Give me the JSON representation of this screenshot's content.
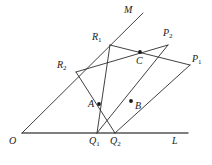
{
  "figure": {
    "width": 212,
    "height": 165,
    "background": "#ffffff",
    "stroke_color": "#2b2b2b",
    "axis_color": "#555555",
    "dot_color": "#1a1a1a",
    "points": {
      "O": {
        "label": "O",
        "sub": "",
        "x": 22,
        "y": 133,
        "label_x": 9,
        "label_y": 136,
        "dot": false
      },
      "L": {
        "label": "L",
        "sub": "",
        "x": 188,
        "y": 133,
        "label_x": 172,
        "label_y": 136,
        "dot": false
      },
      "M": {
        "label": "M",
        "sub": "",
        "x": 143,
        "y": 13,
        "label_x": 124,
        "label_y": 5,
        "dot": false
      },
      "R1": {
        "label": "R",
        "sub": "1",
        "x": 110,
        "y": 45,
        "label_x": 92,
        "label_y": 32,
        "dot": false
      },
      "R2": {
        "label": "R",
        "sub": "2",
        "x": 76,
        "y": 72,
        "label_x": 57,
        "label_y": 60,
        "dot": false
      },
      "P1": {
        "label": "P",
        "sub": "1",
        "x": 190,
        "y": 65,
        "label_x": 192,
        "label_y": 54,
        "dot": false
      },
      "P2": {
        "label": "P",
        "sub": "2",
        "x": 168,
        "y": 45,
        "label_x": 163,
        "label_y": 28,
        "dot": false
      },
      "Q1": {
        "label": "Q",
        "sub": "1",
        "x": 97,
        "y": 133,
        "label_x": 89,
        "label_y": 136,
        "dot": false
      },
      "Q2": {
        "label": "Q",
        "sub": "2",
        "x": 115,
        "y": 133,
        "label_x": 110,
        "label_y": 136,
        "dot": false
      },
      "A": {
        "label": "A",
        "sub": "",
        "x": 99,
        "y": 104,
        "label_x": 88,
        "label_y": 99,
        "dot": true
      },
      "B": {
        "label": "B",
        "sub": "",
        "x": 131,
        "y": 101,
        "label_x": 135,
        "label_y": 101,
        "dot": true
      },
      "C": {
        "label": "C",
        "sub": "",
        "x": 140,
        "y": 52,
        "label_x": 136,
        "label_y": 56,
        "dot": true
      }
    },
    "segments": [
      {
        "name": "base-line-OL",
        "from": "O",
        "to": "L",
        "weight": 1.35,
        "color": "#555555"
      },
      {
        "name": "ray-OM",
        "from": "O",
        "to": "M",
        "weight": 0.9,
        "color": "#2b2b2b"
      },
      {
        "name": "segment-R1-Q1",
        "from": "R1",
        "to": "Q1",
        "weight": 0.9,
        "color": "#2b2b2b"
      },
      {
        "name": "segment-R2-Q2",
        "from": "R2",
        "to": "Q2",
        "weight": 0.9,
        "color": "#2b2b2b"
      },
      {
        "name": "segment-P2-Q1",
        "from": "P2",
        "to": "Q1",
        "weight": 0.9,
        "color": "#2b2b2b"
      },
      {
        "name": "segment-P1-Q2",
        "from": "P1",
        "to": "Q2",
        "weight": 0.9,
        "color": "#2b2b2b"
      },
      {
        "name": "segment-R1-P1",
        "from": "R1",
        "to": "P1",
        "weight": 0.9,
        "color": "#2b2b2b"
      },
      {
        "name": "segment-R2-P2",
        "from": "R2",
        "to": "P2",
        "weight": 0.9,
        "color": "#2b2b2b"
      }
    ],
    "dot_radius": 1.9
  }
}
